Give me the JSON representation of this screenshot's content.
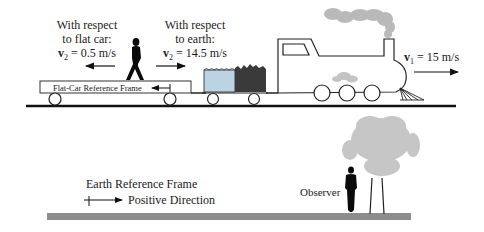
{
  "train_scene": {
    "flat_car_relative": {
      "line1": "With respect",
      "line2": "to flat car:",
      "v_symbol": "v",
      "v_sub": "2",
      "v_value": " = 0.5 m/s"
    },
    "earth_relative": {
      "line1": "With respect",
      "line2": "to earth:",
      "v_symbol": "v",
      "v_sub": "2",
      "v_value": " = 14.5 m/s"
    },
    "flat_car_frame_label": "Flat-Car Reference Frame",
    "train_velocity": {
      "v_symbol": "v",
      "v_sub": "1",
      "v_value": " = 15 m/s"
    }
  },
  "ground_scene": {
    "frame_label": "Earth Reference Frame",
    "positive_direction_label": "Positive Direction",
    "observer_label": "Observer"
  },
  "colors": {
    "water": "#bcd3e3",
    "coal": "#3a3a3a",
    "smoke": "#b9b9b9",
    "tree": "#c6c6c6",
    "ground": "#8c8c8c",
    "ink": "#111111"
  }
}
